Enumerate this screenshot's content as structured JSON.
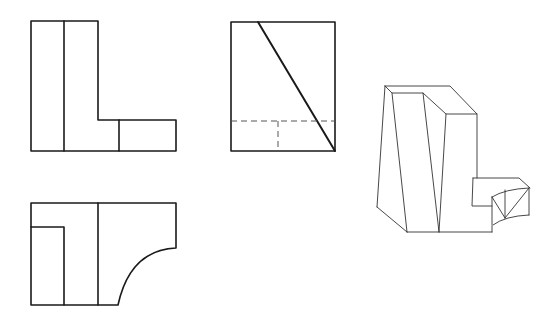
{
  "figure": {
    "type": "orthographic-projection-with-isometric",
    "views": [
      {
        "name": "front-view",
        "label": ""
      },
      {
        "name": "side-view",
        "label": ""
      },
      {
        "name": "top-view",
        "label": ""
      },
      {
        "name": "isometric-view",
        "label": ""
      }
    ],
    "colors": {
      "line": "#1a1a1a",
      "hidden_line": "#555555",
      "background": "#ffffff"
    }
  }
}
